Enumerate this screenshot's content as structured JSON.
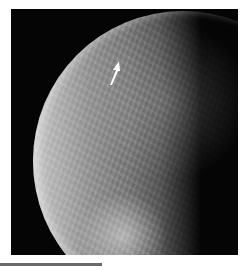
{
  "image": {
    "subject": "moon-surface-photo",
    "background_color": "#050505",
    "annotation": {
      "type": "arrow",
      "color": "#ffffff",
      "direction": "up-right"
    }
  },
  "rule": {
    "color": "#6a6a6a"
  }
}
